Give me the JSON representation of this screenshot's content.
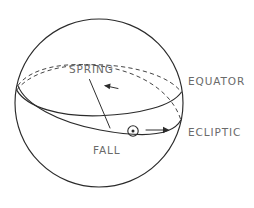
{
  "figure": {
    "name": "celestial-sphere-equator-ecliptic",
    "background_color": "#ffffff",
    "line_color": "#2b2b2b",
    "label_color": "#6a6a6a"
  },
  "labels": {
    "spring": "SPRING",
    "equator": "EQUATOR",
    "ecliptic": "ECLIPTIC",
    "fall": "FALL"
  },
  "geometry": {
    "sphere": {
      "cx": 99,
      "cy": 103,
      "r": 84
    },
    "equator_ellipse": {
      "cx": 99,
      "cy": 103,
      "rx": 84,
      "ry": 26,
      "rotation_deg": -9
    },
    "ecliptic_ellipse": {
      "cx": 99,
      "cy": 103,
      "rx": 84,
      "ry": 26,
      "rotation_deg": 13
    },
    "node_fall_point": {
      "x": 110,
      "y": 128
    },
    "node_spring_point": {
      "x": 89,
      "y": 79
    },
    "sun_symbol": {
      "cx": 133,
      "cy": 131,
      "r": 5.2,
      "dot_r": 1.5
    },
    "sun_motion_arrow": {
      "x1": 146,
      "y1": 130,
      "x2": 169,
      "y2": 130
    },
    "spring_direction_arrow": {
      "x1": 117,
      "y1": 88,
      "x2": 103,
      "y2": 85
    }
  },
  "elements": {
    "sun_icon_name": "sun-symbol-icon",
    "arrow_icon_name": "arrow-right-icon",
    "spring_arrow_icon_name": "arrow-left-icon"
  }
}
